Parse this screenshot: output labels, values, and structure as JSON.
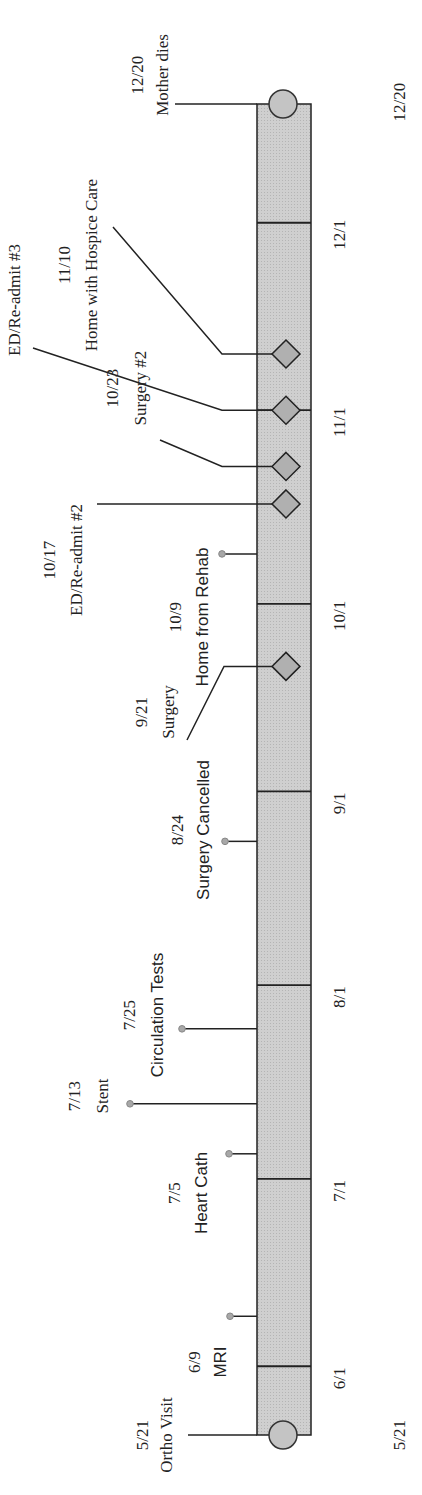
{
  "timeline": {
    "orientation": "rotated-90-ccw",
    "start_label": "5/21",
    "end_label": "12/20",
    "colors": {
      "bar_fill": "#c8c8c8",
      "marker_fill": "#b0b0b0",
      "dot_fill": "#a8a8a8",
      "line": "#222222"
    },
    "ticks": [
      {
        "date": "6/1",
        "day": 11
      },
      {
        "date": "7/1",
        "day": 41
      },
      {
        "date": "8/1",
        "day": 72
      },
      {
        "date": "9/1",
        "day": 103
      },
      {
        "date": "10/1",
        "day": 133
      },
      {
        "date": "11/1",
        "day": 164
      },
      {
        "date": "12/1",
        "day": 194
      }
    ],
    "total_days": 213,
    "events": [
      {
        "date": "5/21",
        "label": "Ortho Visit",
        "day": 0,
        "marker": "circle-end"
      },
      {
        "date": "6/9",
        "label": "MRI",
        "day": 19,
        "marker": "dot"
      },
      {
        "date": "7/5",
        "label": "Heart Cath",
        "day": 45,
        "marker": "dot"
      },
      {
        "date": "7/13",
        "label": "Stent",
        "day": 53,
        "marker": "dot"
      },
      {
        "date": "7/25",
        "label": "Circulation Tests",
        "day": 65,
        "marker": "dot"
      },
      {
        "date": "8/24",
        "label": "Surgery Cancelled",
        "day": 95,
        "marker": "dot"
      },
      {
        "date": "9/21",
        "label": "Surgery",
        "day": 123,
        "marker": "diamond"
      },
      {
        "date": "10/9",
        "label": "Home from Rehab",
        "day": 141,
        "marker": "dot"
      },
      {
        "date": "10/17",
        "label": "ED/Re-admit #2",
        "day": 149,
        "marker": "diamond"
      },
      {
        "date": "10/23",
        "label": "Surgery #2",
        "day": 155,
        "marker": "diamond"
      },
      {
        "date": "11/1",
        "label": "ED/Re-admit #3",
        "day": 164,
        "marker": "diamond"
      },
      {
        "date": "11/10",
        "label": "Home with Hospice Care",
        "day": 173,
        "marker": "diamond"
      },
      {
        "date": "12/20",
        "label": "Mother dies",
        "day": 213,
        "marker": "circle-end"
      }
    ]
  }
}
